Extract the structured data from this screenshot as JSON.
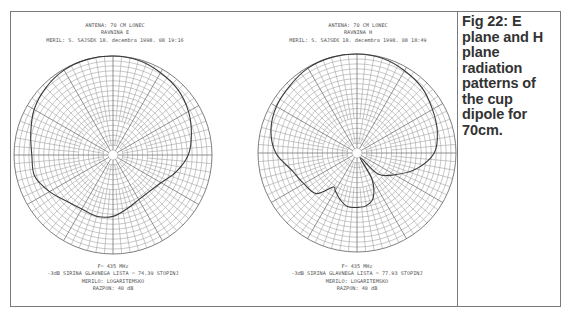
{
  "caption": {
    "text": "Fig 22: E plane and H plane radiation patterns of the cup dipole for 70cm."
  },
  "plots": [
    {
      "header": [
        "ANTENA: 70 CM LONEC",
        "RAVNINA E",
        "MERIL: S. SAJSEK 18. decembra 1998. 08 19:16"
      ],
      "footer": [
        "F= 435 MHz",
        "-3dB SIRINA GLAVNEGA LISTA = 74.39 STOPINJ",
        "MERILO: LOGARITEMSKO",
        "RAZPON: 40 dB"
      ]
    },
    {
      "header": [
        "ANTENA: 70 CM LONEC",
        "RAVNINA H",
        "MERIL: S. SAJSEK 18. decembra 1998. 08 18:49"
      ],
      "footer": [
        "F= 435 MHz",
        "-3dB SIRINA GLAVNEGA LISTA = 77.93 STOPINJ",
        "MERILO: LOGARITEMSKO",
        "RAZPON: 40 dB"
      ]
    }
  ],
  "chart_data": [
    {
      "type": "polar",
      "title": "RAVNINA E (E plane)",
      "subtitle": "ANTENA: 70 CM LONEC",
      "frequency": "435 MHz",
      "beamwidth_3db_deg": 74.39,
      "scale": "logarithmic",
      "range_db": 40,
      "grid": {
        "rings": 20,
        "spokes_deg": 10,
        "major_spokes_deg": 30
      },
      "angle_zero": "top",
      "series": [
        {
          "name": "E plane pattern",
          "angles_deg": [
            0,
            15,
            30,
            45,
            60,
            75,
            90,
            105,
            120,
            135,
            150,
            165,
            180,
            195,
            210,
            225,
            240,
            255,
            270,
            285,
            300,
            315,
            330,
            345
          ],
          "radius_norm": [
            1.0,
            0.99,
            0.96,
            0.93,
            0.88,
            0.82,
            0.76,
            0.66,
            0.56,
            0.52,
            0.52,
            0.56,
            0.62,
            0.64,
            0.63,
            0.66,
            0.74,
            0.82,
            0.82,
            0.86,
            0.92,
            0.96,
            0.99,
            1.0
          ]
        }
      ]
    },
    {
      "type": "polar",
      "title": "RAVNINA H (H plane)",
      "subtitle": "ANTENA: 70 CM LONEC",
      "frequency": "435 MHz",
      "beamwidth_3db_deg": 77.93,
      "scale": "logarithmic",
      "range_db": 40,
      "grid": {
        "rings": 20,
        "spokes_deg": 10,
        "major_spokes_deg": 30
      },
      "angle_zero": "top",
      "series": [
        {
          "name": "H plane pattern",
          "angles_deg": [
            0,
            15,
            30,
            45,
            60,
            75,
            90,
            105,
            120,
            135,
            145,
            150,
            160,
            170,
            180,
            190,
            200,
            210,
            215,
            225,
            240,
            255,
            270,
            285,
            300,
            315,
            330,
            345
          ],
          "radius_norm": [
            1.0,
            0.99,
            0.96,
            0.93,
            0.88,
            0.84,
            0.78,
            0.62,
            0.44,
            0.3,
            0.06,
            0.3,
            0.48,
            0.54,
            0.55,
            0.55,
            0.5,
            0.44,
            0.42,
            0.58,
            0.62,
            0.68,
            0.82,
            0.9,
            0.94,
            0.96,
            0.99,
            1.0
          ]
        }
      ]
    }
  ]
}
